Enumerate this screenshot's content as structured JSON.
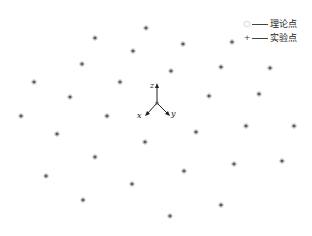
{
  "chart_data": {
    "type": "scatter",
    "title": "",
    "xlabel": "",
    "ylabel": "",
    "grid": false,
    "legend_position": "top-right",
    "legend": [
      {
        "marker": "circle",
        "label": "理论点"
      },
      {
        "marker": "plus",
        "label": "实验点"
      }
    ],
    "axes_glyph": {
      "origin": [
        157,
        103
      ],
      "labels": [
        "z",
        "x",
        "y"
      ]
    },
    "series": [
      {
        "name": "理论点",
        "marker": "circle",
        "color": "#bbbbbb",
        "points": [
          [
            146,
            28
          ],
          [
            95,
            38
          ],
          [
            183,
            44
          ],
          [
            232,
            42
          ],
          [
            133,
            51
          ],
          [
            82,
            64
          ],
          [
            171,
            71
          ],
          [
            221,
            67
          ],
          [
            270,
            68
          ],
          [
            34,
            82
          ],
          [
            120,
            82
          ],
          [
            70,
            97
          ],
          [
            209,
            96
          ],
          [
            259,
            94
          ],
          [
            21,
            116
          ],
          [
            107,
            116
          ],
          [
            196,
            132
          ],
          [
            246,
            126
          ],
          [
            294,
            126
          ],
          [
            57,
            134
          ],
          [
            145,
            142
          ],
          [
            95,
            157
          ],
          [
            234,
            164
          ],
          [
            282,
            161
          ],
          [
            184,
            171
          ],
          [
            46,
            176
          ],
          [
            132,
            184
          ],
          [
            83,
            200
          ],
          [
            221,
            205
          ],
          [
            170,
            216
          ]
        ]
      },
      {
        "name": "实验点",
        "marker": "plus",
        "color": "#333333",
        "points": [
          [
            146,
            28
          ],
          [
            95,
            38
          ],
          [
            183,
            44
          ],
          [
            232,
            42
          ],
          [
            133,
            51
          ],
          [
            82,
            64
          ],
          [
            171,
            71
          ],
          [
            221,
            67
          ],
          [
            270,
            68
          ],
          [
            34,
            82
          ],
          [
            120,
            82
          ],
          [
            70,
            97
          ],
          [
            209,
            96
          ],
          [
            259,
            94
          ],
          [
            21,
            116
          ],
          [
            107,
            116
          ],
          [
            196,
            132
          ],
          [
            246,
            126
          ],
          [
            294,
            126
          ],
          [
            57,
            134
          ],
          [
            145,
            142
          ],
          [
            95,
            157
          ],
          [
            234,
            164
          ],
          [
            282,
            161
          ],
          [
            184,
            171
          ],
          [
            46,
            176
          ],
          [
            132,
            184
          ],
          [
            83,
            200
          ],
          [
            221,
            205
          ],
          [
            170,
            216
          ]
        ]
      }
    ]
  },
  "legend": {
    "theory_label": "理论点",
    "experiment_label": "实验点"
  },
  "axes": {
    "z_label": "z",
    "x_label": "x",
    "y_label": "y"
  }
}
